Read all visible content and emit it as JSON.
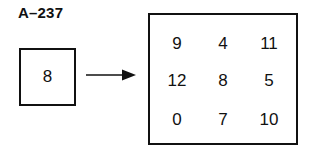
{
  "figure_label": "A–237",
  "input_value": "8",
  "grid": [
    [
      "9",
      "4",
      "11"
    ],
    [
      "12",
      "8",
      "5"
    ],
    [
      "0",
      "7",
      "10"
    ]
  ]
}
